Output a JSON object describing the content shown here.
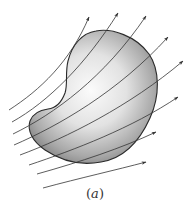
{
  "figure": {
    "caption": "(a)",
    "caption_letter": "a",
    "colors": {
      "background": "#ffffff",
      "surface_light": "#f4f4f4",
      "surface_dark": "#8a8a8a",
      "outline": "#2a2a2a",
      "flow_line": "#333333"
    },
    "flow_lines": [
      {
        "id": 1,
        "start": [
          9,
          110
        ],
        "end": [
          89,
          17
        ]
      },
      {
        "id": 2,
        "start": [
          12,
          122
        ],
        "end": [
          118,
          13
        ]
      },
      {
        "id": 3,
        "start": [
          13,
          134
        ],
        "end": [
          146,
          16
        ]
      },
      {
        "id": 4,
        "start": [
          14,
          145
        ],
        "end": [
          168,
          37
        ]
      },
      {
        "id": 5,
        "start": [
          20,
          155
        ],
        "end": [
          183,
          61
        ]
      },
      {
        "id": 6,
        "start": [
          29,
          165
        ],
        "end": [
          178,
          97
        ]
      },
      {
        "id": 7,
        "start": [
          37,
          174
        ],
        "end": [
          156,
          132
        ]
      },
      {
        "id": 8,
        "start": [
          43,
          188
        ],
        "end": [
          146,
          162
        ]
      }
    ]
  }
}
